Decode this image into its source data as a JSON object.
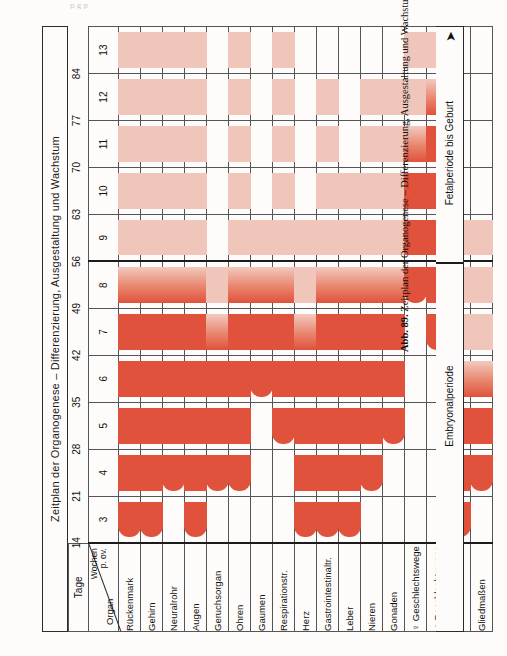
{
  "figure": {
    "title": "Zeitplan der Organogenese – Differenzierung, Ausgestaltung und Wachstum",
    "caption_number": "Abb. 89.",
    "caption_text": "Zeitplan der Organogenese – Differenzierung, Ausgestaltung und Wachstum",
    "cutoff_text": "p g  p"
  },
  "axes": {
    "corner": {
      "organ_label": "Organ",
      "wochen_label": "Wochen",
      "pov_label": "p. ov."
    },
    "days_header": "Tage",
    "day_ticks": [
      "14",
      "21",
      "28",
      "35",
      "42",
      "49",
      "56",
      "63",
      "70",
      "77",
      "84"
    ],
    "weeks": [
      "3",
      "4",
      "5",
      "6",
      "7",
      "8",
      "9",
      "10",
      "11",
      "12",
      "13"
    ]
  },
  "periods": {
    "embryonal": "Embryonalperiode",
    "fetal": "Fetalperiode  bis Geburt",
    "arrow": "arrow-up-icon"
  },
  "colors": {
    "solid_red": "#e0523c",
    "light_pink": "#f0c6bb",
    "mid_pink": "#e68a74",
    "grid": "#555555",
    "thick_rule": "#1b1b1b",
    "paper": "#fdfcfa"
  },
  "chart_data": {
    "type": "bar",
    "title": "Zeitplan der Organogenese – Differenzierung, Ausgestaltung und Wachstum",
    "xlabel": "Wochen p. ov.",
    "ylabel": "Organ",
    "orientation": "horizontal-gantt",
    "categories": [
      "3",
      "4",
      "5",
      "6",
      "7",
      "8",
      "9",
      "10",
      "11",
      "12",
      "13"
    ],
    "day_axis": [
      "14",
      "21",
      "28",
      "35",
      "42",
      "49",
      "56",
      "63",
      "70",
      "77",
      "84"
    ],
    "period_split_after_week": "8",
    "legend": [
      {
        "label": "Hauptperiode der Differenzierung",
        "color": "#e0523c"
      },
      {
        "label": "Periode des Wachstums / Ausgestaltung",
        "color": "#f0c6bb"
      }
    ],
    "rows": [
      {
        "organ": "Rückenmark",
        "solid_start": "3",
        "solid_end": "8",
        "light_end": "13"
      },
      {
        "organ": "Gehirn",
        "solid_start": "3",
        "solid_end": "8",
        "light_end": "13"
      },
      {
        "organ": "Neuralrohr",
        "solid_start": "4",
        "solid_end": "8",
        "light_end": "13"
      },
      {
        "organ": "Augen",
        "solid_start": "3",
        "solid_end": "8",
        "light_end": "13"
      },
      {
        "organ": "Geruchsorgan",
        "solid_start": "4",
        "solid_end": "7",
        "light_end": "8"
      },
      {
        "organ": "Ohren",
        "solid_start": "4",
        "solid_end": "8",
        "light_end": "13"
      },
      {
        "organ": "Gaumen",
        "solid_start": "6",
        "solid_end": "8",
        "light_end": "9"
      },
      {
        "organ": "Respirationstr.",
        "solid_start": "5",
        "solid_end": "8",
        "light_end": "13"
      },
      {
        "organ": "Herz",
        "solid_start": "3",
        "solid_end": "7",
        "light_end": "9"
      },
      {
        "organ": "Gastrointestinaltr.",
        "solid_start": "3",
        "solid_end": "8",
        "light_end": "12"
      },
      {
        "organ": "Leber",
        "solid_start": "3",
        "solid_end": "8",
        "light_end": "10"
      },
      {
        "organ": "Nieren",
        "solid_start": "4",
        "solid_end": "8",
        "light_end": "12"
      },
      {
        "organ": "Gonaden",
        "solid_start": "5",
        "solid_end": "8",
        "light_end": "12"
      },
      {
        "organ": "♀ Geschlechtswege",
        "solid_start": "8",
        "solid_end": "11",
        "light_end": "13"
      },
      {
        "organ": "♂ Geschlechtswege",
        "solid_start": "7",
        "solid_end": "12",
        "light_end": "13"
      },
      {
        "organ": "Gesicht",
        "solid_start": "3",
        "solid_end": "6",
        "light_end": "9"
      },
      {
        "organ": "Gliedmaßen",
        "solid_start": "4",
        "solid_end": "6",
        "light_end": "9"
      }
    ]
  }
}
